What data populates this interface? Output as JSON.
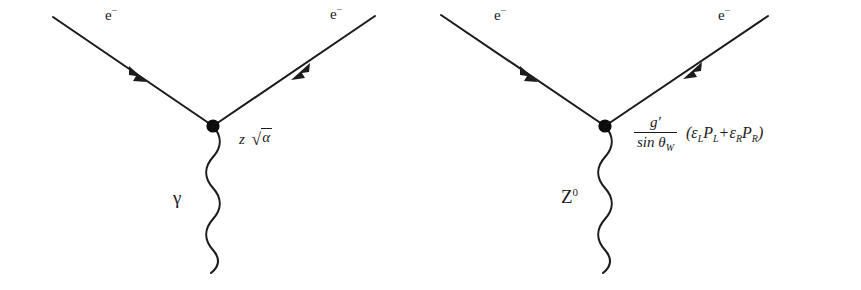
{
  "figure": {
    "background_color": "#ffffff",
    "ink_color": "#1c1c1c"
  },
  "diagrams": [
    {
      "id": "photon-vertex",
      "name": "electron-photon-vertex",
      "incoming_fermion_label": "e",
      "incoming_fermion_charge": "−",
      "outgoing_fermion_label": "e",
      "outgoing_fermion_charge": "−",
      "boson_label": "γ",
      "boson_superscript": "",
      "coupling": {
        "kind": "simple",
        "prefactor": "z",
        "radical_sign": "√",
        "radicand": "α",
        "plain_text": "z √α"
      },
      "geometry": {
        "vertex": [
          213,
          126
        ],
        "incoming_start": [
          53,
          17
        ],
        "outgoing_end": [
          375,
          16
        ],
        "incoming_arrow_at": [
          137,
          74
        ],
        "outgoing_arrow_at": [
          300,
          72
        ],
        "wavy_end": [
          211,
          272
        ],
        "wave_cycles": 6,
        "wave_amplitude": 7
      }
    },
    {
      "id": "z-boson-vertex",
      "name": "electron-z-boson-vertex",
      "incoming_fermion_label": "e",
      "incoming_fermion_charge": "−",
      "outgoing_fermion_label": "e",
      "outgoing_fermion_charge": "−",
      "boson_label": "Z",
      "boson_superscript": "0",
      "coupling": {
        "kind": "fraction",
        "numerator": "g′",
        "denominator_function": "sin",
        "denominator_symbol": "θ",
        "denominator_subscript": "W",
        "open_paren": "(",
        "term1_coefficient": "ε",
        "term1_coefficient_sub": "L",
        "term1_projector": "P",
        "term1_projector_sub": "L",
        "operator": "+",
        "term2_coefficient": "ε",
        "term2_coefficient_sub": "R",
        "term2_projector": "P",
        "term2_projector_sub": "R",
        "close_paren": ")",
        "plain_text": "g′ / sin θ_W (ε_L P_L + ε_R P_R)"
      },
      "geometry": {
        "vertex": [
          605,
          126
        ],
        "incoming_start": [
          441,
          15
        ],
        "outgoing_end": [
          768,
          16
        ],
        "incoming_arrow_at": [
          528,
          74
        ],
        "outgoing_arrow_at": [
          692,
          71
        ],
        "wavy_end": [
          603,
          272
        ],
        "wave_cycles": 6,
        "wave_amplitude": 7
      }
    }
  ]
}
